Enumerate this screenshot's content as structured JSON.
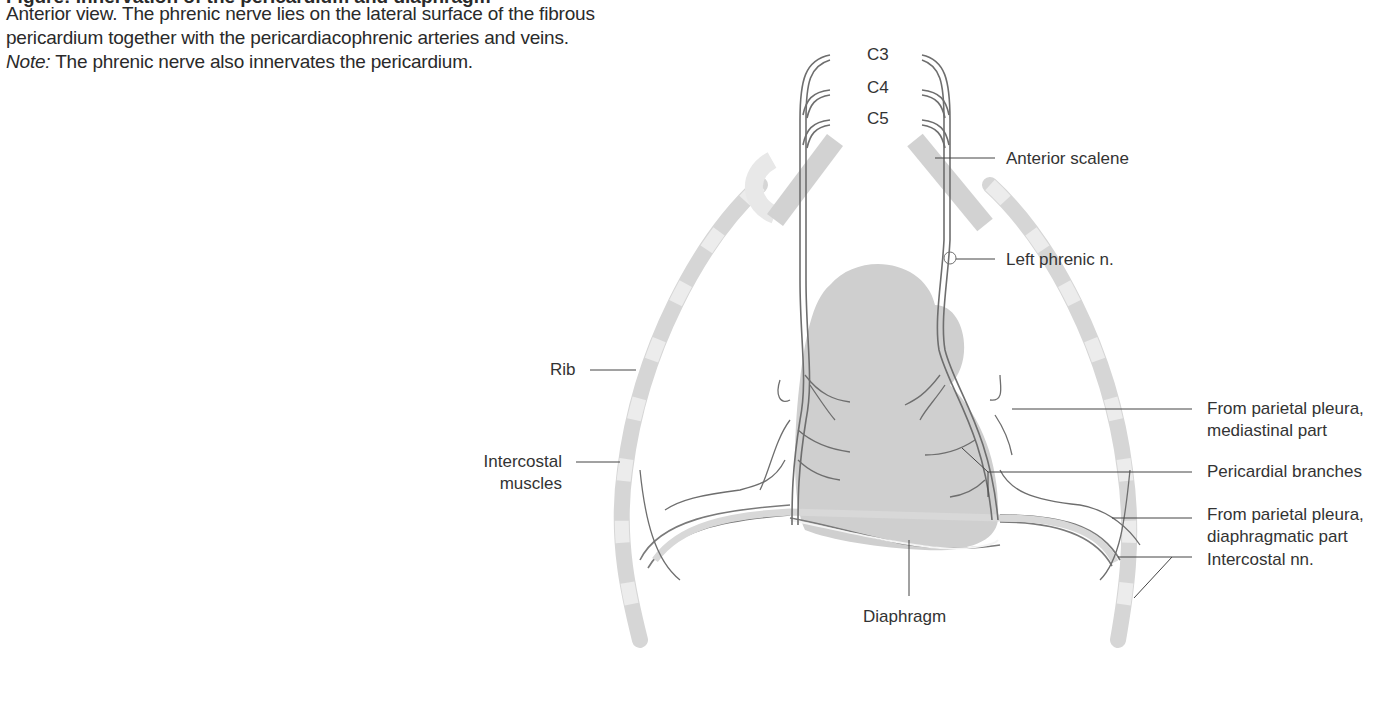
{
  "figure": {
    "title_clipped": "Figure: Innervation of the pericardium and diaphragm",
    "caption": {
      "line1": "Anterior view. The phrenic nerve lies on the lateral surface of the fibrous",
      "line2": "pericardium together with the pericardiacophrenic arteries and veins.",
      "note_label": "Note:",
      "note_text": " The phrenic nerve also innervates the pericardium."
    }
  },
  "labels": {
    "c3": "C3",
    "c4": "C4",
    "c5": "C5",
    "anterior_scalene": "Anterior scalene",
    "left_phrenic": "Left phrenic n.",
    "rib": "Rib",
    "intercostal_muscles_1": "Intercostal",
    "intercostal_muscles_2": "muscles",
    "parietal_mediastinal_1": "From parietal pleura,",
    "parietal_mediastinal_2": "mediastinal part",
    "pericardial_branches": "Pericardial branches",
    "parietal_diaphragmatic_1": "From parietal pleura,",
    "parietal_diaphragmatic_2": "diaphragmatic part",
    "intercostal_nn": "Intercostal nn.",
    "diaphragm": "Diaphragm"
  },
  "colors": {
    "text": "#2a2a2a",
    "nerve": "#6e6e6e",
    "heart_fill": "#cfcfcf",
    "rib_fill": "#d6d6d6",
    "rib_light": "#ececec",
    "leader": "#444444"
  }
}
